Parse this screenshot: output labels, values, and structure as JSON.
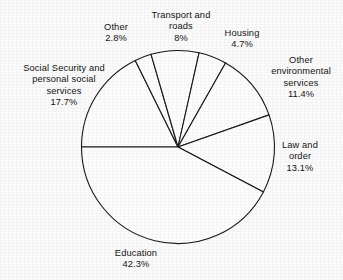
{
  "chart_data": {
    "type": "pie",
    "title": "",
    "subtitle": "",
    "xlabel": "",
    "ylabel": "",
    "legend_position": "none",
    "grid": false,
    "label_style": "outside-callout",
    "start_angle_deg": 180,
    "direction": "clockwise",
    "categories": [
      "Social Security and personal social services",
      "Other",
      "Transport and roads",
      "Housing",
      "Other environmental services",
      "Law and order",
      "Education"
    ],
    "values": [
      17.7,
      2.8,
      8,
      4.7,
      11.4,
      13.1,
      42.3
    ],
    "units": "%",
    "slices": [
      {
        "name": "Social Security and personal social services",
        "label": "Social Security and\npersonal social\nservices",
        "value": 17.7,
        "value_label": "17.7%"
      },
      {
        "name": "Other",
        "label": "Other",
        "value": 2.8,
        "value_label": "2.8%"
      },
      {
        "name": "Transport and roads",
        "label": "Transport and\nroads",
        "value": 8,
        "value_label": "8%"
      },
      {
        "name": "Housing",
        "label": "Housing",
        "value": 4.7,
        "value_label": "4.7%"
      },
      {
        "name": "Other environmental services",
        "label": "Other\nenvironmental\nservices",
        "value": 11.4,
        "value_label": "11.4%"
      },
      {
        "name": "Law and order",
        "label": "Law and\norder",
        "value": 13.1,
        "value_label": "13.1%"
      },
      {
        "name": "Education",
        "label": "Education",
        "value": 42.3,
        "value_label": "42.3%"
      }
    ]
  },
  "labels": {
    "social": "Social Security and\npersonal social\nservices\n17.7%",
    "other": "Other\n2.8%",
    "transport": "Transport and\nroads\n8%",
    "housing": "Housing\n4.7%",
    "environment": "Other\nenvironmental\nservices\n11.4%",
    "law": "Law and\norder\n13.1%",
    "education": "Education\n42.3%"
  },
  "colors": {
    "slice_fill": "#fdfdfd",
    "slice_stroke": "#151515",
    "text": "#111111",
    "background": "#fbfbfb"
  }
}
